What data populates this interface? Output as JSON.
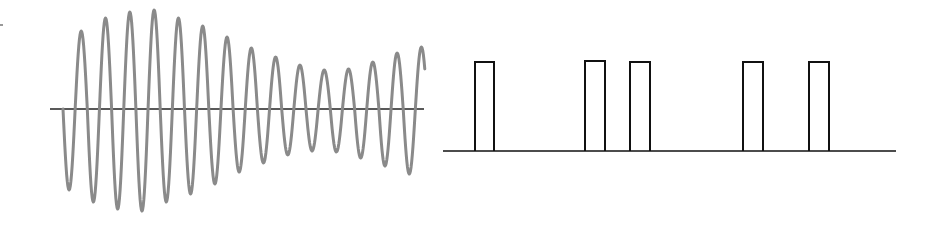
{
  "figure": {
    "colors": {
      "wave": "#8a8a8a",
      "axis": "#222222",
      "pulse": "#111111",
      "background": "#ffffff"
    }
  },
  "left_panel": {
    "axis": {
      "y": 109,
      "x_start": 50,
      "x_end": 424
    },
    "wave": {
      "x_start": 63,
      "period": 24.3,
      "cycles": 15,
      "peaks_y": [
        31,
        18,
        12,
        10,
        18,
        26,
        37,
        48,
        57,
        65,
        70,
        69,
        62,
        53,
        47
      ],
      "troughs_y": [
        190,
        202,
        209,
        211,
        202,
        194,
        184,
        172,
        163,
        155,
        151,
        152,
        158,
        166,
        174
      ]
    }
  },
  "right_panel": {
    "baseline": {
      "y": 151,
      "x_start": 443,
      "x_end": 896
    },
    "pulses": [
      {
        "x0": 475,
        "x1": 494,
        "top": 62
      },
      {
        "x0": 585,
        "x1": 605,
        "top": 61
      },
      {
        "x0": 630,
        "x1": 650,
        "top": 62
      },
      {
        "x0": 743,
        "x1": 763,
        "top": 62
      },
      {
        "x0": 809,
        "x1": 829,
        "top": 62
      }
    ]
  }
}
